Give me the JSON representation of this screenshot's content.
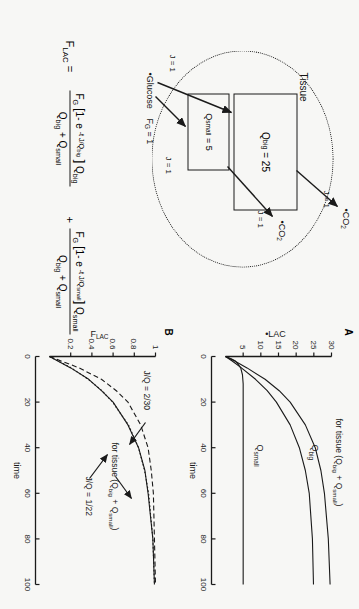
{
  "figure": {
    "equation_number": "(23)",
    "background_color": "#f7f7f5",
    "ink_color": "#1a1a1a"
  },
  "equation": {
    "lhs": "F",
    "lhs_sub": "LAC",
    "equals": "=",
    "plus": "+",
    "term1": {
      "numerator_prefix": "F",
      "numerator_prefix_sub": "G",
      "numerator": "[1- e  -t J/Q big ] Q big",
      "denominator": "Q big + Q small"
    },
    "term2": {
      "numerator_prefix": "F",
      "numerator_prefix_sub": "G",
      "numerator": "[1- e  -t J/Q small ] Q small",
      "denominator": "Q big + Q small"
    }
  },
  "diagram": {
    "compartment_label": "Tissue",
    "big_box": {
      "symbol": "Q",
      "sub": "big",
      "equals": "= 25",
      "value": 25
    },
    "small_box": {
      "symbol": "Q",
      "sub": "small",
      "equals": "= 5",
      "value": 5
    },
    "inputs": [
      {
        "species": "•Glucose",
        "flux_label": "J = 1",
        "target": "Q_big"
      },
      {
        "species": "F",
        "species_sub": "G",
        "species_value": "= 1",
        "flux_label": "J = 1",
        "target": "Q_small"
      }
    ],
    "outputs": [
      {
        "species": "•CO",
        "species_sub": "2",
        "flux_label": "J = 1",
        "source": "Q_big"
      },
      {
        "species": "•CO",
        "species_sub": "2",
        "flux_label": "J = 1",
        "source": "Q_small"
      }
    ]
  },
  "chart_data": [
    {
      "type": "line",
      "panel": "A",
      "title": "",
      "xlabel": "time",
      "ylabel": "•LAC",
      "xlim": [
        0,
        100
      ],
      "ylim": [
        0,
        30
      ],
      "xticks": [
        0,
        20,
        40,
        60,
        80,
        100
      ],
      "yticks": [
        5,
        10,
        15,
        20,
        25,
        30
      ],
      "xtick_labels": [
        "0",
        "20",
        "40",
        "60",
        "80",
        "100"
      ],
      "ytick_labels": [
        "5",
        "10",
        "15",
        "20",
        "25",
        "30"
      ],
      "grid": false,
      "legend": "inline-annotations",
      "series": [
        {
          "name": "for tissue (Qbig + Qsmall)",
          "label": "for tissue (Q",
          "label_sub1": "big",
          "label_mid": "  + Q",
          "label_sub2": "small",
          "label_end": ")",
          "style": "solid",
          "plateau": 30,
          "tau": 22,
          "x": [
            0,
            2,
            5,
            10,
            15,
            20,
            30,
            40,
            50,
            60,
            80,
            100
          ],
          "y": [
            0,
            2.6,
            6.1,
            11.2,
            15.2,
            18.3,
            22.6,
            25.4,
            27.0,
            28.0,
            29.1,
            29.6
          ]
        },
        {
          "name": "Qbig",
          "label": "Q",
          "label_sub1": "big",
          "style": "solid",
          "plateau": 25,
          "tau": 25,
          "x": [
            0,
            2,
            5,
            10,
            15,
            20,
            30,
            40,
            50,
            60,
            80,
            100
          ],
          "y": [
            0,
            1.9,
            4.5,
            8.5,
            11.8,
            14.4,
            18.3,
            20.9,
            22.6,
            23.7,
            24.6,
            24.9
          ]
        },
        {
          "name": "Qsmall",
          "label": "Q",
          "label_sub1": "small",
          "style": "solid",
          "plateau": 5,
          "tau": 2.5,
          "x": [
            0,
            1,
            2,
            3,
            5,
            8,
            12,
            20,
            40,
            60,
            80,
            100
          ],
          "y": [
            0,
            1.6,
            2.8,
            3.4,
            4.3,
            4.8,
            5.0,
            5.0,
            5.0,
            5.0,
            5.0,
            5.0
          ]
        }
      ]
    },
    {
      "type": "line",
      "panel": "B",
      "title": "",
      "xlabel": "time",
      "ylabel": "F",
      "ylabel_sub": "LAC",
      "xlim": [
        0,
        100
      ],
      "ylim": [
        0,
        1
      ],
      "xticks": [
        0,
        20,
        40,
        60,
        80,
        100
      ],
      "yticks": [
        0.2,
        0.4,
        0.6,
        0.8,
        1
      ],
      "xtick_labels": [
        "0",
        "20",
        "40",
        "60",
        "80",
        "100"
      ],
      "ytick_labels": [
        "0.2",
        "0.4",
        "0.6",
        "0.8",
        "1"
      ],
      "grid": false,
      "annotations": [
        {
          "text": "J/Q  = 2/30",
          "points_to": "dashed-curve"
        },
        {
          "text": "J/Q  = 1/22",
          "points_to": "dotted-curve"
        },
        {
          "text": "for tissue (Q",
          "sub1": "big",
          "mid": "  + Q",
          "sub2": "small",
          "end": ")",
          "points_to": "solid-curve"
        }
      ],
      "series": [
        {
          "name": "J/Q = 2/30 (dashed)",
          "style": "dashed",
          "tau": 15,
          "x": [
            0,
            5,
            10,
            15,
            20,
            30,
            40,
            50,
            60,
            80,
            100
          ],
          "y": [
            0,
            0.28,
            0.49,
            0.63,
            0.74,
            0.86,
            0.93,
            0.96,
            0.98,
            0.99,
            1.0
          ]
        },
        {
          "name": "for tissue (Qbig + Qsmall) (solid)",
          "style": "solid",
          "tau": 22,
          "x": [
            0,
            5,
            10,
            15,
            20,
            30,
            40,
            50,
            60,
            80,
            100
          ],
          "y": [
            0,
            0.2,
            0.37,
            0.49,
            0.6,
            0.74,
            0.84,
            0.9,
            0.93,
            0.975,
            0.99
          ]
        },
        {
          "name": "J/Q = 1/22 (dotted)",
          "style": "dotted",
          "tau": 22,
          "x": [
            0,
            5,
            10,
            15,
            20,
            30,
            40,
            50,
            60,
            80,
            100
          ],
          "y": [
            0,
            0.205,
            0.365,
            0.495,
            0.595,
            0.745,
            0.84,
            0.897,
            0.935,
            0.975,
            0.99
          ]
        }
      ]
    }
  ]
}
